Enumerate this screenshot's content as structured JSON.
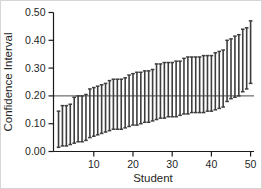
{
  "chart_data": {
    "type": "errorbar",
    "title": "",
    "xlabel": "Student",
    "ylabel": "Confidence Interval",
    "x_ticks": [
      10,
      20,
      30,
      40,
      50
    ],
    "y_ticks": [
      "0.00",
      "0.10",
      "0.20",
      "0.30",
      "0.40",
      "0.50"
    ],
    "y_tick_values": [
      0.0,
      0.1,
      0.2,
      0.3,
      0.4,
      0.5
    ],
    "ylim": [
      0.0,
      0.5
    ],
    "xlim": [
      0,
      51
    ],
    "n_students": 50,
    "reference_line_value": 0.2,
    "legend": "none",
    "grid": "off",
    "intervals": [
      [
        0.015,
        0.145
      ],
      [
        0.02,
        0.165
      ],
      [
        0.02,
        0.165
      ],
      [
        0.025,
        0.17
      ],
      [
        0.03,
        0.195
      ],
      [
        0.035,
        0.2
      ],
      [
        0.035,
        0.2
      ],
      [
        0.04,
        0.205
      ],
      [
        0.05,
        0.225
      ],
      [
        0.055,
        0.23
      ],
      [
        0.06,
        0.235
      ],
      [
        0.065,
        0.24
      ],
      [
        0.07,
        0.245
      ],
      [
        0.075,
        0.255
      ],
      [
        0.08,
        0.26
      ],
      [
        0.08,
        0.26
      ],
      [
        0.08,
        0.26
      ],
      [
        0.085,
        0.265
      ],
      [
        0.09,
        0.275
      ],
      [
        0.095,
        0.28
      ],
      [
        0.095,
        0.285
      ],
      [
        0.1,
        0.285
      ],
      [
        0.105,
        0.29
      ],
      [
        0.105,
        0.29
      ],
      [
        0.11,
        0.295
      ],
      [
        0.115,
        0.315
      ],
      [
        0.12,
        0.315
      ],
      [
        0.12,
        0.32
      ],
      [
        0.125,
        0.32
      ],
      [
        0.125,
        0.32
      ],
      [
        0.125,
        0.325
      ],
      [
        0.13,
        0.325
      ],
      [
        0.135,
        0.335
      ],
      [
        0.135,
        0.34
      ],
      [
        0.14,
        0.34
      ],
      [
        0.14,
        0.34
      ],
      [
        0.14,
        0.34
      ],
      [
        0.14,
        0.345
      ],
      [
        0.145,
        0.345
      ],
      [
        0.145,
        0.345
      ],
      [
        0.15,
        0.355
      ],
      [
        0.155,
        0.36
      ],
      [
        0.16,
        0.365
      ],
      [
        0.18,
        0.4
      ],
      [
        0.19,
        0.405
      ],
      [
        0.195,
        0.415
      ],
      [
        0.2,
        0.42
      ],
      [
        0.215,
        0.44
      ],
      [
        0.225,
        0.445
      ],
      [
        0.245,
        0.47
      ]
    ],
    "colors": {
      "bar": "#3d3d3d",
      "axis": "#1a1a1a",
      "reference_line": "#4d4d4d",
      "text": "#1f1f1f",
      "background": "#ffffff"
    }
  }
}
